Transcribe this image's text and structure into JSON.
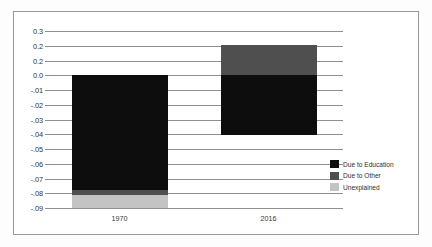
{
  "chart_data": {
    "type": "bar",
    "title": "",
    "subtitle": "",
    "xlabel": "",
    "ylabel": "",
    "stacked": true,
    "grid": true,
    "legend_position": "right-inside",
    "categories": [
      "1970",
      "2016"
    ],
    "ytick_labels": [
      "0.3",
      "0.2",
      "0.2",
      "0.0",
      "-.01",
      "-.02",
      "-.03",
      "-.04",
      "-.05",
      "-.06",
      "-.07",
      "-.08",
      "-.09"
    ],
    "ytick_values": [
      0.03,
      0.02,
      0.01,
      0.0,
      -0.01,
      -0.02,
      -0.03,
      -0.04,
      -0.05,
      -0.06,
      -0.07,
      -0.08,
      -0.09
    ],
    "ylim": [
      -0.09,
      0.03
    ],
    "zero_value": 0.0,
    "series": [
      {
        "name": "Due to Education",
        "color": "#0d0d0d",
        "values": [
          -0.0775,
          -0.0405
        ]
      },
      {
        "name": "Due to Other",
        "color": "#4f4f4f",
        "values": [
          -0.0035,
          0.0205
        ]
      },
      {
        "name": "Unexplained",
        "color": "#c3c3c3",
        "values": [
          -0.009,
          0.0
        ]
      }
    ]
  },
  "legend": {
    "items": [
      {
        "label": "Due to Education",
        "color": "#0d0d0d"
      },
      {
        "label": "Due to Other",
        "color": "#4f4f4f"
      },
      {
        "label": "Unexplained",
        "color": "#c3c3c3"
      }
    ]
  }
}
